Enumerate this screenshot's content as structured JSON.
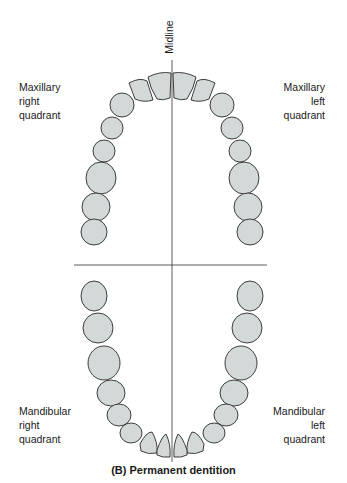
{
  "labels": {
    "midline": "Midline",
    "maxillary_right": [
      "Maxillary",
      "right",
      "quadrant"
    ],
    "maxillary_left": [
      "Maxillary",
      "left",
      "quadrant"
    ],
    "mandibular_right": [
      "Mandibular",
      "right",
      "quadrant"
    ],
    "mandibular_left": [
      "Mandibular",
      "left",
      "quadrant"
    ]
  },
  "caption": "(B) Permanent dentition",
  "colors": {
    "tooth_fill": "#d3d8d8",
    "tooth_stroke": "#2a2a2a",
    "line": "#333333"
  },
  "diagram": {
    "teeth_per_quadrant": 8,
    "quadrants": [
      "Maxillary right",
      "Maxillary left",
      "Mandibular right",
      "Mandibular left"
    ]
  }
}
